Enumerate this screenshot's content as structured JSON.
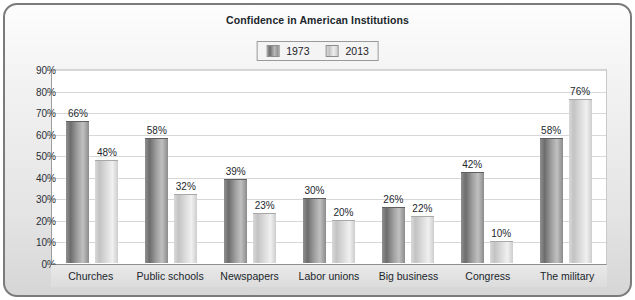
{
  "chart_data": {
    "type": "bar",
    "title": "Confidence in American Institutions",
    "xlabel": "",
    "ylabel": "",
    "ylim": [
      0,
      90
    ],
    "ytick_labels": [
      "90%",
      "80%",
      "70%",
      "60%",
      "50%",
      "40%",
      "30%",
      "20%",
      "10%",
      "0%"
    ],
    "ytick_values": [
      90,
      80,
      70,
      60,
      50,
      40,
      30,
      20,
      10,
      0
    ],
    "grid": true,
    "legend_position": "top-center",
    "categories": [
      "Churches",
      "Public schools",
      "Newspapers",
      "Labor unions",
      "Big business",
      "Congress",
      "The military"
    ],
    "series": [
      {
        "name": "1973",
        "color": "#8a8a8a",
        "values": [
          66,
          58,
          39,
          30,
          26,
          42,
          58
        ],
        "labels": [
          "66%",
          "58%",
          "39%",
          "30%",
          "26%",
          "42%",
          "58%"
        ]
      },
      {
        "name": "2013",
        "color": "#d5d5d5",
        "values": [
          48,
          32,
          23,
          20,
          22,
          10,
          76
        ],
        "labels": [
          "48%",
          "32%",
          "23%",
          "20%",
          "22%",
          "10%",
          "76%"
        ]
      }
    ]
  },
  "legend": {
    "items": [
      {
        "label": "1973",
        "swatch": "legend-swatch-1973"
      },
      {
        "label": "2013",
        "swatch": "legend-swatch-2013"
      }
    ]
  },
  "colors": {
    "frame_border": "#7b7b7b",
    "plot_background": "#ffffff",
    "gridline": "#d8d8d8",
    "text": "#20262b"
  }
}
